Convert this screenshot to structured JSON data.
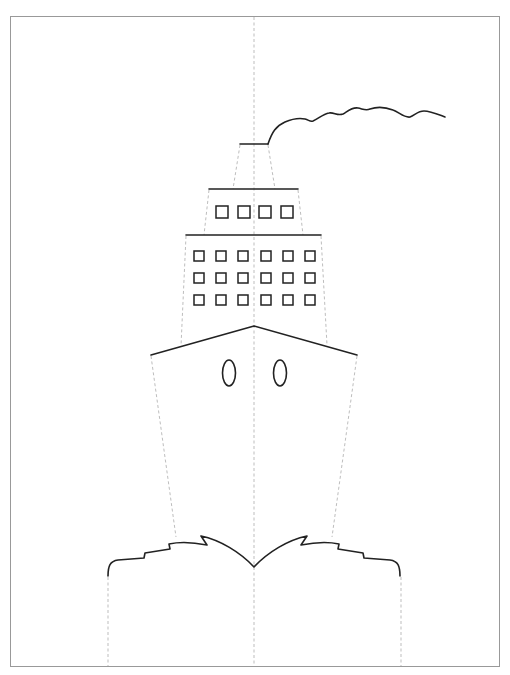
{
  "diagram": {
    "title": "",
    "legend": {
      "solid_line": "cut line",
      "dashed_line": "fold line"
    },
    "colors": {
      "cut_line": "#222222",
      "fold_line": "#b5b5b5",
      "border": "#999999",
      "background": "#ffffff"
    },
    "parts": {
      "smoke": "smoke-plume",
      "funnel": "funnel",
      "upper_deck": {
        "name": "upper-deck",
        "window_rows": 1,
        "window_cols": 4
      },
      "lower_deck": {
        "name": "lower-deck",
        "window_rows": 3,
        "window_cols": 6
      },
      "hull": {
        "name": "hull",
        "portholes": 2
      },
      "waves": "bow-waves"
    }
  }
}
